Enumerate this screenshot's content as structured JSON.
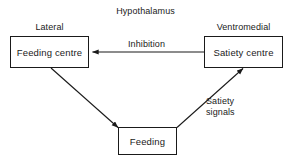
{
  "diagram": {
    "title": "Hypothalamus",
    "colors": {
      "background": "#ffffff",
      "stroke": "#1a1a1a",
      "text": "#1a1a1a"
    },
    "nodes": [
      {
        "id": "lateral",
        "caption": "Lateral",
        "label": "Feeding centre"
      },
      {
        "id": "ventromedial",
        "caption": "Ventromedial",
        "label": "Satiety centre"
      },
      {
        "id": "feeding",
        "caption": "",
        "label": "Feeding"
      }
    ],
    "edges": [
      {
        "id": "inhibition",
        "label": "Inhibition",
        "from": "ventromedial",
        "to": "lateral"
      },
      {
        "id": "feeding-drive",
        "label": "",
        "from": "lateral",
        "to": "feeding"
      },
      {
        "id": "satiety-signals",
        "label_line1": "Satiety",
        "label_line2": "signals",
        "from": "feeding",
        "to": "ventromedial"
      }
    ]
  }
}
